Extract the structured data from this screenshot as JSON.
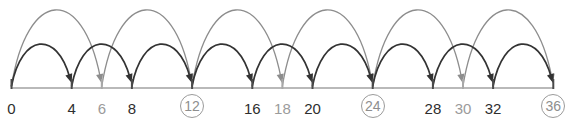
{
  "figure": {
    "kind": "number-line-skip-counting-diagram",
    "colors": {
      "axis": "#b9b9b9",
      "tick_dark": "#4a4a4a",
      "tick_gray": "#a8a8a8",
      "arc_dark": "#333333",
      "arc_gray": "#8d8d8d",
      "label_dark": "#2e2e2e",
      "label_gray": "#9b9b9b",
      "circle_ring": "#9b9b9b",
      "background": "#ffffff"
    }
  },
  "chart_data": {
    "type": "line",
    "title": "",
    "xlabel": "",
    "ylabel": "",
    "xlim": [
      0,
      36
    ],
    "grid": false,
    "legend": null,
    "axis": {
      "min": 0,
      "max": 36,
      "pixel_origin_x": 11.5,
      "pixel_per_unit": 15.05,
      "pixel_y": 88
    },
    "ticks": [
      {
        "value": 0,
        "label": "0",
        "style": "dark",
        "tick_color": "dark"
      },
      {
        "value": 4,
        "label": "4",
        "style": "dark",
        "tick_color": "dark"
      },
      {
        "value": 6,
        "label": "6",
        "style": "gray",
        "tick_color": "gray"
      },
      {
        "value": 8,
        "label": "8",
        "style": "dark",
        "tick_color": "dark"
      },
      {
        "value": 12,
        "label": "12",
        "style": "circled",
        "tick_color": "dark"
      },
      {
        "value": 16,
        "label": "16",
        "style": "dark",
        "tick_color": "dark"
      },
      {
        "value": 18,
        "label": "18",
        "style": "gray",
        "tick_color": "gray"
      },
      {
        "value": 20,
        "label": "20",
        "style": "dark",
        "tick_color": "dark"
      },
      {
        "value": 24,
        "label": "24",
        "style": "circled",
        "tick_color": "dark"
      },
      {
        "value": 28,
        "label": "28",
        "style": "dark",
        "tick_color": "dark"
      },
      {
        "value": 30,
        "label": "30",
        "style": "gray",
        "tick_color": "gray"
      },
      {
        "value": 32,
        "label": "32",
        "style": "dark",
        "tick_color": "dark"
      },
      {
        "value": 36,
        "label": "36",
        "style": "circled",
        "tick_color": "dark"
      }
    ],
    "series": [
      {
        "name": "skip-count-by-4",
        "color": "#333333",
        "step": 4,
        "arc_height": 43,
        "direction": "below",
        "jumps": [
          {
            "from": 0,
            "to": 4
          },
          {
            "from": 4,
            "to": 8
          },
          {
            "from": 8,
            "to": 12
          },
          {
            "from": 12,
            "to": 16
          },
          {
            "from": 16,
            "to": 20
          },
          {
            "from": 20,
            "to": 24
          },
          {
            "from": 24,
            "to": 28
          },
          {
            "from": 28,
            "to": 32
          },
          {
            "from": 32,
            "to": 36
          }
        ]
      },
      {
        "name": "skip-count-by-6",
        "color": "#8d8d8d",
        "step": 6,
        "arc_height": 78,
        "direction": "above",
        "jumps": [
          {
            "from": 0,
            "to": 6
          },
          {
            "from": 6,
            "to": 12
          },
          {
            "from": 12,
            "to": 18
          },
          {
            "from": 18,
            "to": 24
          },
          {
            "from": 24,
            "to": 30
          },
          {
            "from": 30,
            "to": 36
          }
        ]
      }
    ],
    "highlighted_values": [
      12,
      24,
      36
    ],
    "annotation": "Common multiples of 4 and 6 are circled: 12, 24, 36"
  }
}
